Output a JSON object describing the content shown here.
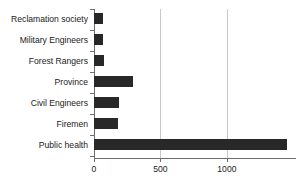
{
  "chart_data": {
    "type": "bar",
    "orientation": "horizontal",
    "title": "",
    "xlabel": "",
    "ylabel": "",
    "categories": [
      "Reclamation society",
      "Military Engineers",
      "Forest Rangers",
      "Province",
      "Civil Engineers",
      "Firemen",
      "Public health"
    ],
    "values": [
      70,
      70,
      75,
      290,
      185,
      180,
      1450
    ],
    "xlim": [
      0,
      1520
    ],
    "xticks": [
      0,
      500,
      1000
    ],
    "xticklabels": [
      "0",
      "500",
      "1000"
    ],
    "gridlines": [
      500,
      1000
    ],
    "grid": true,
    "legend": null,
    "bar_color": "#282828",
    "grid_color": "#c9c9c9",
    "axis_color": "#6e6e6e"
  },
  "axis": {
    "x_tick_labels": [
      "0",
      "500",
      "1000"
    ],
    "category_labels": [
      "Reclamation society",
      "Military Engineers",
      "Forest Rangers",
      "Province",
      "Civil Engineers",
      "Firemen",
      "Public health"
    ]
  }
}
